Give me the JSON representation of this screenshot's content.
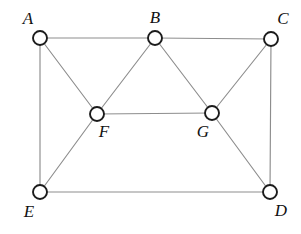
{
  "figure": {
    "kind": "undirected-graph-diagram",
    "width": 301,
    "height": 234,
    "background_color": "#ffffff",
    "edge_color": "#8d8d8d",
    "vertex_stroke_color": "#1b1b1b",
    "vertex_fill_color": "#ffffff",
    "label_color": "#111111",
    "vertex_radius": 7,
    "edge_width": 1.15,
    "vertex_stroke_width": 1.9
  },
  "vertices": [
    {
      "id": "A",
      "label": "A",
      "cx": 40,
      "cy": 38,
      "lx": 28,
      "ly": 24,
      "anchor": "middle"
    },
    {
      "id": "B",
      "label": "B",
      "cx": 155,
      "cy": 38,
      "lx": 155,
      "ly": 23,
      "anchor": "middle"
    },
    {
      "id": "C",
      "label": "C",
      "cx": 271,
      "cy": 39,
      "lx": 283,
      "ly": 24,
      "anchor": "middle"
    },
    {
      "id": "F",
      "label": "F",
      "cx": 97,
      "cy": 114,
      "lx": 104,
      "ly": 137,
      "anchor": "middle"
    },
    {
      "id": "G",
      "label": "G",
      "cx": 212,
      "cy": 113,
      "lx": 203,
      "ly": 137,
      "anchor": "middle"
    },
    {
      "id": "E",
      "label": "E",
      "cx": 40,
      "cy": 192,
      "lx": 29,
      "ly": 217,
      "anchor": "middle"
    },
    {
      "id": "D",
      "label": "D",
      "cx": 270,
      "cy": 192,
      "lx": 281,
      "ly": 216,
      "anchor": "middle"
    }
  ],
  "edges": [
    {
      "from": "A",
      "to": "B",
      "x1": 40,
      "y1": 38,
      "x2": 155,
      "y2": 38
    },
    {
      "from": "B",
      "to": "C",
      "x1": 155,
      "y1": 38,
      "x2": 271,
      "y2": 39
    },
    {
      "from": "A",
      "to": "E",
      "x1": 40,
      "y1": 38,
      "x2": 40,
      "y2": 192
    },
    {
      "from": "C",
      "to": "D",
      "x1": 271,
      "y1": 39,
      "x2": 270,
      "y2": 192
    },
    {
      "from": "E",
      "to": "D",
      "x1": 40,
      "y1": 192,
      "x2": 270,
      "y2": 192
    },
    {
      "from": "A",
      "to": "F",
      "x1": 40,
      "y1": 38,
      "x2": 97,
      "y2": 114
    },
    {
      "from": "B",
      "to": "F",
      "x1": 155,
      "y1": 38,
      "x2": 97,
      "y2": 114
    },
    {
      "from": "B",
      "to": "G",
      "x1": 155,
      "y1": 38,
      "x2": 212,
      "y2": 113
    },
    {
      "from": "C",
      "to": "G",
      "x1": 271,
      "y1": 39,
      "x2": 212,
      "y2": 113
    },
    {
      "from": "F",
      "to": "G",
      "x1": 97,
      "y1": 114,
      "x2": 212,
      "y2": 113
    },
    {
      "from": "F",
      "to": "E",
      "x1": 97,
      "y1": 114,
      "x2": 40,
      "y2": 192
    },
    {
      "from": "G",
      "to": "D",
      "x1": 212,
      "y1": 113,
      "x2": 270,
      "y2": 192
    }
  ]
}
